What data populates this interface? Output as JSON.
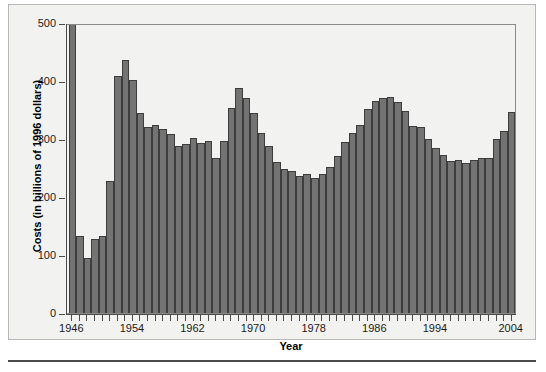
{
  "figure": {
    "bottom_rule_present": true,
    "panel_background": "#f2f2f0",
    "bar_fill": "#737373",
    "bar_edge": "#3d3d3d",
    "axis_color": "#4a4a4a"
  },
  "chart_data": {
    "type": "bar",
    "title": "",
    "subtitle": "",
    "xlabel": "Year",
    "ylabel": "Costs (in billions of 1996 dollars)",
    "xlim": [
      1945.3,
      2004.7
    ],
    "ylim": [
      0,
      500
    ],
    "ytick_values": [
      0,
      100,
      200,
      300,
      400,
      500
    ],
    "ytick_labels": [
      "0",
      "100",
      "200",
      "300",
      "400",
      "500"
    ],
    "xtick_values": [
      1946,
      1954,
      1962,
      1970,
      1978,
      1986,
      1994,
      2004
    ],
    "xtick_labels": [
      "1946",
      "1954",
      "1962",
      "1970",
      "1978",
      "1986",
      "1994",
      "2004"
    ],
    "minor_xticks_every": 1,
    "grid": false,
    "legend": null,
    "categories": [
      1946,
      1947,
      1948,
      1949,
      1950,
      1951,
      1952,
      1953,
      1954,
      1955,
      1956,
      1957,
      1958,
      1959,
      1960,
      1961,
      1962,
      1963,
      1964,
      1965,
      1966,
      1967,
      1968,
      1969,
      1970,
      1971,
      1972,
      1973,
      1974,
      1975,
      1976,
      1977,
      1978,
      1979,
      1980,
      1981,
      1982,
      1983,
      1984,
      1985,
      1986,
      1987,
      1988,
      1989,
      1990,
      1991,
      1992,
      1993,
      1994,
      1995,
      1996,
      1997,
      1998,
      1999,
      2000,
      2001,
      2002,
      2003,
      2004
    ],
    "values": [
      520,
      133,
      95,
      127,
      133,
      227,
      408,
      437,
      402,
      345,
      321,
      324,
      318,
      308,
      288,
      292,
      301,
      293,
      296,
      267,
      297,
      353,
      388,
      371,
      345,
      310,
      288,
      261,
      249,
      245,
      237,
      240,
      233,
      240,
      252,
      271,
      295,
      311,
      325,
      352,
      365,
      370,
      372,
      364,
      349,
      322,
      320,
      300,
      285,
      272,
      262,
      263,
      258,
      263,
      268,
      267,
      300,
      314,
      347
    ],
    "clipped_indices": [
      0
    ]
  }
}
